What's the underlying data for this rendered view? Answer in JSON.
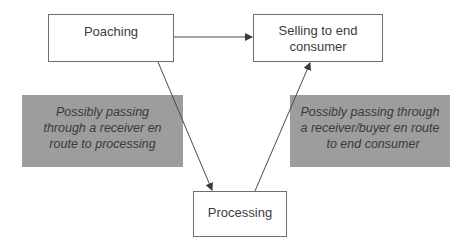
{
  "diagram": {
    "nodes": {
      "poaching": {
        "label": "Poaching"
      },
      "selling": {
        "lines": [
          "Selling to end",
          "consumer"
        ]
      },
      "processing": {
        "label": "Processing"
      }
    },
    "notes": {
      "left": {
        "lines": [
          "Possibly passing",
          "through a receiver en",
          "route to processing"
        ],
        "fill": "#9d9d9d"
      },
      "right": {
        "lines": [
          "Possibly passing through",
          "a receiver/buyer en route",
          "to end consumer"
        ],
        "fill": "#9d9d9d"
      }
    },
    "edges": [
      {
        "from": "poaching",
        "to": "selling",
        "type": "arrow"
      },
      {
        "from": "poaching",
        "to": "processing",
        "type": "arrow"
      },
      {
        "from": "processing",
        "to": "selling",
        "type": "arrow"
      }
    ],
    "colors": {
      "node_border": "#6e6e6e",
      "edge": "#4a4a4a",
      "text": "#3a3a3a"
    }
  }
}
